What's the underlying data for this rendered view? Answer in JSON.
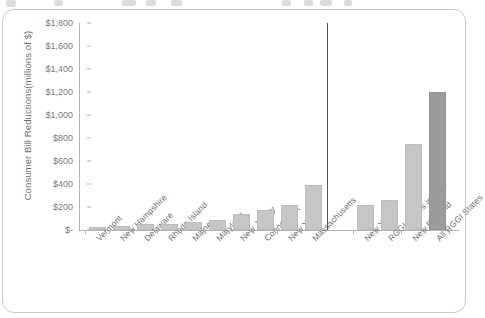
{
  "chart_data": {
    "type": "bar",
    "title": "",
    "xlabel": "",
    "ylabel": "Consumer Bill Reductions(millions of $)",
    "ylim": [
      0,
      1800
    ],
    "ytick_labels": [
      "$1,800",
      "$1,600",
      "$1,400",
      "$1,200",
      "$1,000",
      "$800",
      "$600",
      "$400",
      "$200",
      "$-"
    ],
    "ytick_values": [
      1800,
      1600,
      1400,
      1200,
      1000,
      800,
      600,
      400,
      200,
      0
    ],
    "grid": false,
    "legend": "none",
    "groups": [
      {
        "name": "individual-states",
        "categories": [
          "Vermont",
          "New Hampshire",
          "Delaware",
          "Rhode Island",
          "Maine",
          "Maryland",
          "New Jersey",
          "Connecticut",
          "New York",
          "Massachusetts"
        ],
        "values": [
          25,
          35,
          50,
          50,
          70,
          90,
          135,
          170,
          220,
          390
        ]
      },
      {
        "name": "regions",
        "categories": [
          "New York",
          "RGGI States in PJM",
          "New England",
          "All RGGI States"
        ],
        "values": [
          220,
          260,
          750,
          1200
        ]
      }
    ],
    "categories": [
      "Vermont",
      "New Hampshire",
      "Delaware",
      "Rhode Island",
      "Maine",
      "Maryland",
      "New Jersey",
      "Connecticut",
      "New York",
      "Massachusetts",
      "New York",
      "RGGI States in PJM",
      "New England",
      "All RGGI States"
    ],
    "values": [
      25,
      35,
      50,
      50,
      70,
      90,
      135,
      170,
      220,
      390,
      220,
      260,
      750,
      1200
    ],
    "colors": {
      "bar_light": "#c6c6c6",
      "bar_dark": "#9b9b9b",
      "axis": "#b3b3b3",
      "separator": "#555555",
      "text": "#6f6f6f",
      "card_border": "#c9c9c9",
      "background": "#ffffff"
    },
    "highlight_index": 13,
    "separator_after_index": 9
  }
}
